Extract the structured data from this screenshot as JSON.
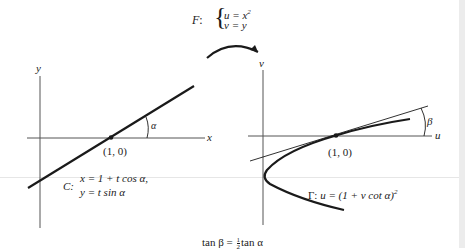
{
  "mapping": {
    "name": "F",
    "colon": ":",
    "eq1": "u = x",
    "eq1_exp": "2",
    "eq2": "v = y"
  },
  "left_graph": {
    "x_axis_label": "x",
    "y_axis_label": "y",
    "angle_label": "α",
    "point_label": "(1, 0)",
    "curve_name": "C:",
    "curve_eq1": "x = 1 + t cos α,",
    "curve_eq2": "y = t sin α"
  },
  "right_graph": {
    "u_axis_label": "u",
    "v_axis_label": "v",
    "angle_label": "β",
    "point_label": "(1, 0)",
    "curve_name": "Γ:",
    "curve_eq": "u = (1 + v cot α)",
    "curve_eq_exp": "2"
  },
  "caption": {
    "lhs": "tan β =",
    "frac_num": "1",
    "frac_den": "2",
    "rhs": "tan α"
  },
  "colors": {
    "ink": "#1a1a1a",
    "axis": "#555555",
    "background": "#ffffff"
  }
}
